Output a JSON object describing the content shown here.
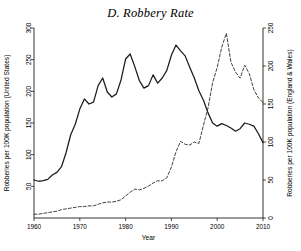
{
  "chart_data": {
    "type": "line",
    "title": "D. Robbery Rate",
    "xlabel": "Year",
    "ylabel": "Robberies per 100K population (United States)",
    "y2label": "Robberies per 100K population (England & Wales)",
    "xlim": [
      1960,
      2010
    ],
    "ylim": [
      0,
      300
    ],
    "y2lim": [
      0,
      250
    ],
    "xticks": [
      1960,
      1970,
      1980,
      1990,
      2000,
      2010
    ],
    "yticks": [
      50,
      100,
      150,
      200,
      250,
      300
    ],
    "y2ticks": [
      0,
      50,
      100,
      150,
      200,
      250
    ],
    "grid": false,
    "legend": "none",
    "series": [
      {
        "name": "United States",
        "axis": "left",
        "style": "solid",
        "color": "#1a1a1a",
        "x": [
          1960,
          1961,
          1962,
          1963,
          1964,
          1965,
          1966,
          1967,
          1968,
          1969,
          1970,
          1971,
          1972,
          1973,
          1974,
          1975,
          1976,
          1977,
          1978,
          1979,
          1980,
          1981,
          1982,
          1983,
          1984,
          1985,
          1986,
          1987,
          1988,
          1989,
          1990,
          1991,
          1992,
          1993,
          1994,
          1995,
          1996,
          1997,
          1998,
          1999,
          2000,
          2001,
          2002,
          2003,
          2004,
          2005,
          2006,
          2007,
          2008,
          2009,
          2010
        ],
        "values": [
          60,
          58,
          59,
          61,
          68,
          72,
          81,
          103,
          131,
          148,
          172,
          188,
          180,
          183,
          209,
          221,
          199,
          191,
          196,
          218,
          251,
          259,
          239,
          217,
          205,
          209,
          226,
          213,
          221,
          233,
          257,
          273,
          264,
          256,
          238,
          221,
          201,
          186,
          166,
          150,
          145,
          149,
          146,
          142,
          137,
          141,
          150,
          148,
          145,
          133,
          119
        ]
      },
      {
        "name": "England & Wales",
        "axis": "right",
        "style": "dashed",
        "color": "#2b2b2b",
        "x": [
          1960,
          1961,
          1962,
          1963,
          1964,
          1965,
          1966,
          1967,
          1968,
          1969,
          1970,
          1971,
          1972,
          1973,
          1974,
          1975,
          1976,
          1977,
          1978,
          1979,
          1980,
          1981,
          1982,
          1983,
          1984,
          1985,
          1986,
          1987,
          1988,
          1989,
          1990,
          1991,
          1992,
          1993,
          1994,
          1995,
          1996,
          1997,
          1998,
          1999,
          2000,
          2001,
          2002,
          2003,
          2004,
          2005,
          2006,
          2007,
          2008,
          2009,
          2010
        ],
        "values": [
          5,
          5,
          6,
          7,
          8,
          9,
          11,
          12,
          13,
          14,
          15,
          15,
          16,
          16,
          18,
          20,
          21,
          21,
          22,
          24,
          29,
          34,
          38,
          37,
          39,
          42,
          46,
          49,
          49,
          53,
          67,
          87,
          101,
          97,
          96,
          100,
          98,
          122,
          145,
          178,
          198,
          225,
          243,
          205,
          192,
          184,
          201,
          190,
          169,
          158,
          152
        ]
      }
    ]
  },
  "axes": {
    "left_title": "Robberies per 100K population (United States)",
    "right_title": "Robberies per 100K population (England & Wales)",
    "x_title": "Year"
  }
}
